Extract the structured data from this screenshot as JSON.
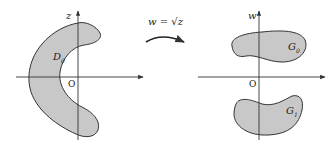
{
  "diagram": {
    "left_plane": {
      "axis_label": "z",
      "origin_label": "O",
      "region_label": "D",
      "region_sub": "0",
      "fill": "#c8c8c8",
      "stroke": "#333333"
    },
    "mapping": {
      "label": "w = √z"
    },
    "right_plane": {
      "axis_label": "w",
      "origin_label": "O",
      "regions": [
        {
          "label": "G",
          "sub": "0"
        },
        {
          "label": "G",
          "sub": "1"
        }
      ],
      "fill": "#c8c8c8",
      "stroke": "#333333"
    }
  }
}
